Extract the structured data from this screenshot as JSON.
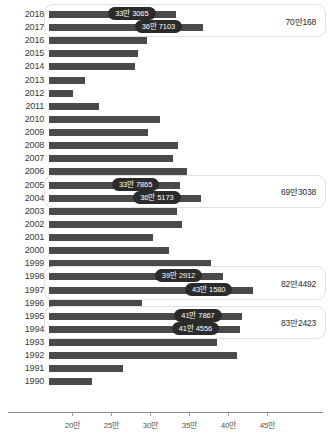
{
  "chart_data": {
    "type": "bar",
    "title": "",
    "xlabel": "",
    "ylabel": "",
    "orientation": "horizontal",
    "unit": "만",
    "xlim": [
      17.0,
      48.0
    ],
    "axis_ticks": [
      {
        "value": 20,
        "label": "20만"
      },
      {
        "value": 25,
        "label": "25만"
      },
      {
        "value": 30,
        "label": "30만"
      },
      {
        "value": 35,
        "label": "35만"
      },
      {
        "value": 40,
        "label": "40만"
      },
      {
        "value": 45,
        "label": "45만"
      }
    ],
    "grid": false,
    "legend": "none",
    "categories": [
      "2018",
      "2017",
      "2016",
      "2015",
      "2014",
      "2013",
      "2012",
      "2011",
      "2010",
      "2009",
      "2008",
      "2007",
      "2006",
      "2005",
      "2004",
      "2003",
      "2002",
      "2001",
      "2000",
      "1999",
      "1998",
      "1997",
      "1996",
      "1995",
      "1994",
      "1993",
      "1992",
      "1991",
      "1990"
    ],
    "values": [
      33.3065,
      36.7103,
      29.6,
      28.4,
      28.0,
      21.6,
      20.1,
      23.4,
      31.2,
      29.7,
      33.5,
      32.9,
      34.7,
      33.7865,
      36.5173,
      33.4,
      34.0,
      30.3,
      32.4,
      37.8,
      39.2912,
      43.158,
      28.9,
      41.7867,
      41.4556,
      38.5,
      41.1,
      26.5,
      22.5
    ],
    "series": [
      {
        "name": "출생아 수",
        "points": [
          {
            "category": "2018",
            "value": 33.3065,
            "label": "33만 3065",
            "label_shown": true
          },
          {
            "category": "2017",
            "value": 36.7103,
            "label": "36만 7103",
            "label_shown": true
          },
          {
            "category": "2016",
            "value": 29.6,
            "label": "",
            "label_shown": false
          },
          {
            "category": "2015",
            "value": 28.4,
            "label": "",
            "label_shown": false
          },
          {
            "category": "2014",
            "value": 28.0,
            "label": "",
            "label_shown": false
          },
          {
            "category": "2013",
            "value": 21.6,
            "label": "",
            "label_shown": false
          },
          {
            "category": "2012",
            "value": 20.1,
            "label": "",
            "label_shown": false
          },
          {
            "category": "2011",
            "value": 23.4,
            "label": "",
            "label_shown": false
          },
          {
            "category": "2010",
            "value": 31.2,
            "label": "",
            "label_shown": false
          },
          {
            "category": "2009",
            "value": 29.7,
            "label": "",
            "label_shown": false
          },
          {
            "category": "2008",
            "value": 33.5,
            "label": "",
            "label_shown": false
          },
          {
            "category": "2007",
            "value": 32.9,
            "label": "",
            "label_shown": false
          },
          {
            "category": "2006",
            "value": 34.7,
            "label": "",
            "label_shown": false
          },
          {
            "category": "2005",
            "value": 33.7865,
            "label": "33만 7865",
            "label_shown": true
          },
          {
            "category": "2004",
            "value": 36.5173,
            "label": "36만 5173",
            "label_shown": true
          },
          {
            "category": "2003",
            "value": 33.4,
            "label": "",
            "label_shown": false
          },
          {
            "category": "2002",
            "value": 34.0,
            "label": "",
            "label_shown": false
          },
          {
            "category": "2001",
            "value": 30.3,
            "label": "",
            "label_shown": false
          },
          {
            "category": "2000",
            "value": 32.4,
            "label": "",
            "label_shown": false
          },
          {
            "category": "1999",
            "value": 37.8,
            "label": "",
            "label_shown": false
          },
          {
            "category": "1998",
            "value": 39.2912,
            "label": "39만 2912",
            "label_shown": true
          },
          {
            "category": "1997",
            "value": 43.158,
            "label": "43만 1580",
            "label_shown": true
          },
          {
            "category": "1996",
            "value": 28.9,
            "label": "",
            "label_shown": false
          },
          {
            "category": "1995",
            "value": 41.7867,
            "label": "41만 7867",
            "label_shown": true
          },
          {
            "category": "1994",
            "value": 41.4556,
            "label": "41만 4556",
            "label_shown": true
          },
          {
            "category": "1993",
            "value": 38.5,
            "label": "",
            "label_shown": false
          },
          {
            "category": "1992",
            "value": 41.1,
            "label": "",
            "label_shown": false
          },
          {
            "category": "1991",
            "value": 26.5,
            "label": "",
            "label_shown": false
          },
          {
            "category": "1990",
            "value": 22.5,
            "label": "",
            "label_shown": false
          }
        ]
      }
    ],
    "annotations": [
      {
        "name": "group-2017-2018",
        "categories": [
          "2018",
          "2017"
        ],
        "sum_label": "70만168"
      },
      {
        "name": "group-2004-2005",
        "categories": [
          "2005",
          "2004"
        ],
        "sum_label": "69만3038"
      },
      {
        "name": "group-1997-1998",
        "categories": [
          "1998",
          "1997"
        ],
        "sum_label": "82만4492"
      },
      {
        "name": "group-1994-1995",
        "categories": [
          "1995",
          "1994"
        ],
        "sum_label": "83만2423"
      }
    ]
  },
  "colors": {
    "bar": "#4a4a4a",
    "pill_bg": "#2b2b2b",
    "pill_text": "#ffffff",
    "axis": "#8c8c8c",
    "group_border": "#e0e0e0",
    "label_text": "#3a3a3a"
  }
}
